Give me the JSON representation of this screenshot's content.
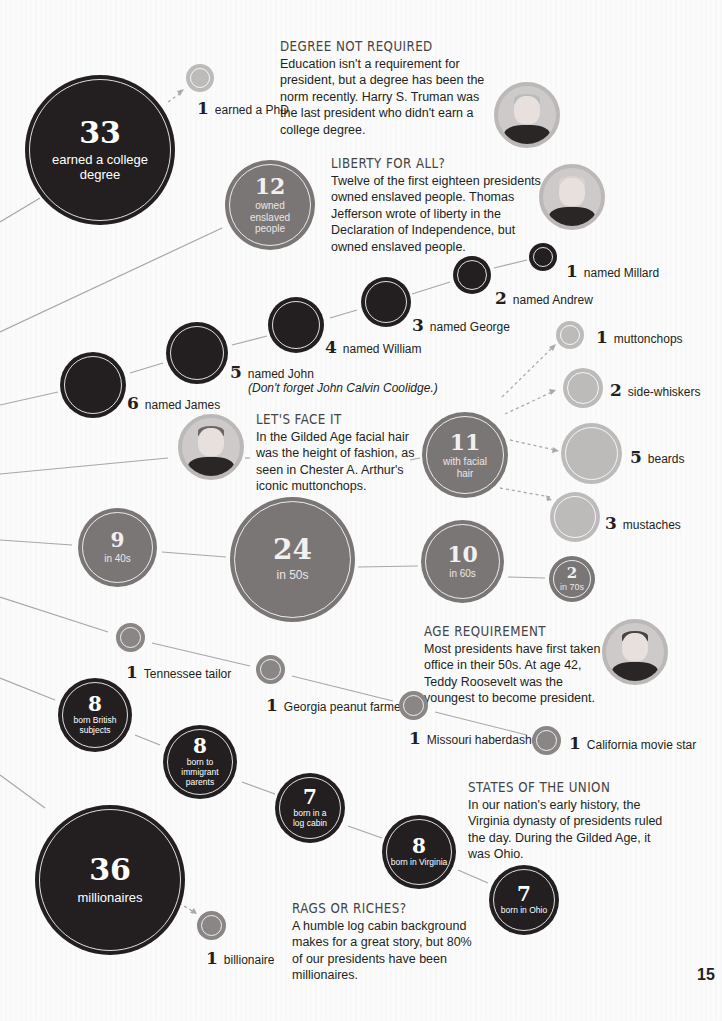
{
  "page_number": "15",
  "colors": {
    "dark_circle": "#231f20",
    "gray_circle": "#7b7676",
    "light_circle": "#bdbaba",
    "background": "#fbfbfb",
    "connector": "#a9a6a6"
  },
  "education": {
    "main": {
      "value": "33",
      "label": "earned a college degree"
    },
    "phd": {
      "value": "1",
      "label": "earned a PhD"
    },
    "note": {
      "heading": "DEGREE NOT REQUIRED",
      "body": "Education isn't a requirement for president, but a degree has been the norm recently. Harry S. Truman was the last president who didn't earn a college degree.",
      "portrait": "Harry S. Truman"
    }
  },
  "slavery": {
    "main": {
      "value": "12",
      "label": "owned enslaved people"
    },
    "note": {
      "heading": "LIBERTY FOR ALL?",
      "body": "Twelve of the first eighteen presidents owned enslaved people. Thomas Jefferson wrote of liberty in the Declaration of Independence, but owned enslaved people.",
      "portrait": "Thomas Jefferson"
    }
  },
  "names": {
    "items": [
      {
        "value": "6",
        "label": "named James"
      },
      {
        "value": "5",
        "label": "named John"
      },
      {
        "value": "4",
        "label": "named William"
      },
      {
        "value": "3",
        "label": "named George"
      },
      {
        "value": "2",
        "label": "named Andrew"
      },
      {
        "value": "1",
        "label": "named Millard"
      }
    ],
    "john_note": "(Don't forget John Calvin Coolidge.)"
  },
  "facial_hair": {
    "main": {
      "value": "11",
      "label": "with facial hair"
    },
    "items": [
      {
        "value": "1",
        "label": "muttonchops"
      },
      {
        "value": "2",
        "label": "side-whiskers"
      },
      {
        "value": "5",
        "label": "beards"
      },
      {
        "value": "3",
        "label": "mustaches"
      }
    ],
    "note": {
      "heading": "LET'S FACE IT",
      "body": "In the Gilded Age facial hair was the height of fashion, as seen in Chester A. Arthur's iconic muttonchops.",
      "portrait": "Chester A. Arthur"
    }
  },
  "age": {
    "items": [
      {
        "value": "9",
        "label": "in 40s"
      },
      {
        "value": "24",
        "label": "in 50s"
      },
      {
        "value": "10",
        "label": "in 60s"
      },
      {
        "value": "2",
        "label": "in 70s"
      }
    ],
    "note": {
      "heading": "AGE REQUIREMENT",
      "body": "Most presidents have first taken office in their 50s. At age 42, Teddy Roosevelt was the youngest to become president.",
      "portrait": "Teddy Roosevelt"
    }
  },
  "occupations": {
    "items": [
      {
        "value": "1",
        "label": "Tennessee tailor"
      },
      {
        "value": "1",
        "label": "Georgia peanut farmer"
      },
      {
        "value": "1",
        "label": "Missouri haberdasher"
      },
      {
        "value": "1",
        "label": "California movie star"
      }
    ]
  },
  "birth": {
    "items": [
      {
        "value": "8",
        "label": "born British subjects"
      },
      {
        "value": "8",
        "label": "born to immigrant parents"
      },
      {
        "value": "7",
        "label": "born in a log cabin"
      },
      {
        "value": "8",
        "label": "born in Virginia"
      },
      {
        "value": "7",
        "label": "born in Ohio"
      }
    ],
    "note": {
      "heading": "STATES OF THE UNION",
      "body": "In our nation's early history, the Virginia dynasty of presidents ruled the day. During the Gilded Age, it was Ohio."
    }
  },
  "wealth": {
    "main": {
      "value": "36",
      "label": "millionaires"
    },
    "billionaire": {
      "value": "1",
      "label": "billionaire"
    },
    "note": {
      "heading": "RAGS OR RICHES?",
      "body": "A humble log cabin background makes for a great story, but 80% of our presidents have been millionaires."
    }
  }
}
